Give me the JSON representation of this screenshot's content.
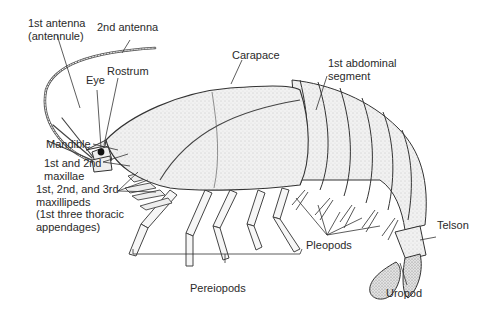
{
  "diagram": {
    "labels": {
      "antenna1": "1st antenna\n(antennule)",
      "antenna2": "2nd antenna",
      "eye": "Eye",
      "rostrum": "Rostrum",
      "carapace": "Carapace",
      "abdominal": "1st abdominal\nsegment",
      "mandible": "Mandible",
      "maxillae": "1st and 2nd\nmaxillae",
      "maxillipeds": "1st, 2nd, and 3rd\nmaxillipeds\n(1st three thoracic\nappendages)",
      "pereiopods": "Pereiopods",
      "pleopods": "Pleopods",
      "telson": "Telson",
      "uropod": "Uropod"
    },
    "colors": {
      "line": "#3a3a3a",
      "body_fill": "#eeeeee",
      "shade": "#c8c8c8",
      "text": "#2a2a2a",
      "background": "#ffffff"
    }
  }
}
